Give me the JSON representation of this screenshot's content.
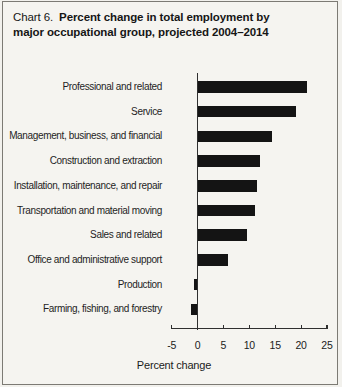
{
  "title": {
    "prefix": "Chart 6.",
    "line1": "Percent change in total employment by",
    "line2": "major occupational group, projected 2004–2014"
  },
  "chart_data": {
    "type": "bar",
    "orientation": "horizontal",
    "categories": [
      "Professional and related",
      "Service",
      "Management, business, and financial",
      "Construction and extraction",
      "Installation, maintenance, and repair",
      "Transportation and material moving",
      "Sales and related",
      "Office and administrative support",
      "Production",
      "Farming, fishing, and forestry"
    ],
    "values": [
      21.2,
      19.0,
      14.4,
      12.0,
      11.4,
      11.1,
      9.6,
      5.8,
      -0.7,
      -1.3
    ],
    "xlabel": "Percent change",
    "xlim": [
      -5,
      25
    ],
    "xticks": [
      -5,
      0,
      5,
      10,
      15,
      20,
      25
    ],
    "bar_color": "#141414",
    "grid": false,
    "legend": false
  }
}
